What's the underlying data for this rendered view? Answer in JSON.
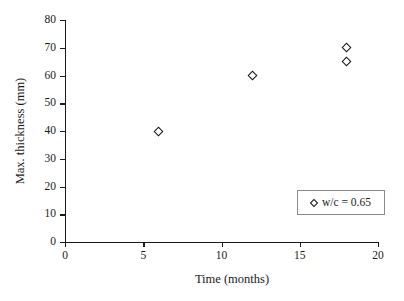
{
  "chart_data": {
    "type": "scatter",
    "title": "",
    "subtitle": "",
    "xlabel": "Time (months)",
    "ylabel": "Max. thickness (mm)",
    "xlim": [
      0,
      20
    ],
    "ylim": [
      0,
      80
    ],
    "xticks": [
      0,
      5,
      10,
      15,
      20
    ],
    "yticks": [
      0,
      10,
      20,
      30,
      40,
      50,
      60,
      70,
      80
    ],
    "xtick_labels": [
      "0",
      "5",
      "10",
      "15",
      "20"
    ],
    "ytick_labels": [
      "0",
      "10",
      "20",
      "30",
      "40",
      "50",
      "60",
      "70",
      "80"
    ],
    "grid": false,
    "background_color": "#ffffff",
    "axis_color": "#1a1a1a",
    "legend_position": "lower-right",
    "legend_border_color": "#8a8a8a",
    "series": [
      {
        "name": "w/c = 0.65",
        "marker": "open-diamond",
        "marker_edge_color": "#111111",
        "marker_face_color": "#ffffff",
        "points": [
          {
            "x": 6,
            "y": 40
          },
          {
            "x": 12,
            "y": 60
          },
          {
            "x": 18,
            "y": 70
          },
          {
            "x": 18,
            "y": 65
          }
        ]
      }
    ]
  },
  "legend": {
    "entries": [
      {
        "label": "w/c = 0.65",
        "marker_name": "open-diamond-marker"
      }
    ]
  }
}
